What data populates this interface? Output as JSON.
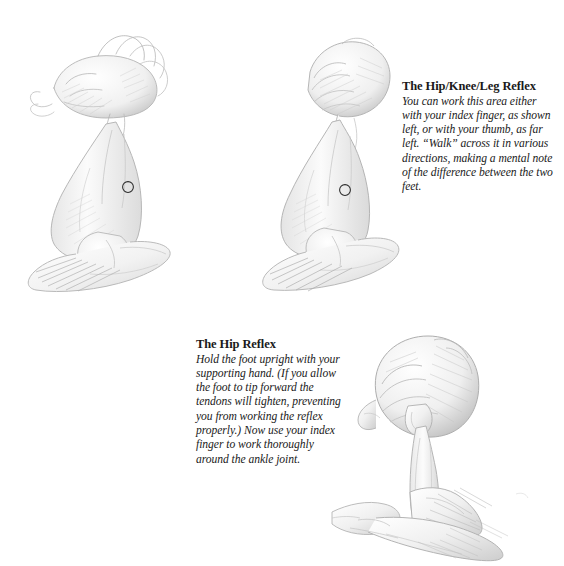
{
  "page": {
    "background_color": "#ffffff",
    "text_color": "#1a1a1a",
    "width": 564,
    "height": 566
  },
  "blocks": [
    {
      "id": "hip-knee-leg",
      "heading": "The Hip/Knee/Leg Reflex",
      "body": "You can work this area either with your index finger, as shown left, or with your thumb, as far left. “Walk” across it in various directions, making a mental note of the difference between the two feet."
    },
    {
      "id": "hip",
      "heading": "The Hip Reflex",
      "body": "Hold the foot upright with your supporting hand. (If you allow the foot to tip forward the tendons will tighten, preventing you from working the reflex properly.) Now use your index finger to work thoroughly around the ankle joint."
    }
  ],
  "illustrations": [
    {
      "id": "thumb-technique",
      "name": "hand-working-foot-with-thumb-illustration",
      "caption_ref": "hip-knee-leg",
      "marker": {
        "label": "reflex-point-marker",
        "shape": "circle"
      }
    },
    {
      "id": "index-finger-technique",
      "name": "hand-working-foot-with-index-finger-illustration",
      "caption_ref": "hip-knee-leg",
      "marker": {
        "label": "reflex-point-marker",
        "shape": "circle"
      }
    },
    {
      "id": "ankle-joint-technique",
      "name": "hand-working-ankle-joint-illustration",
      "caption_ref": "hip"
    }
  ],
  "marker_color": "#2b2b2b",
  "pencil_color": "#9a9a9a"
}
